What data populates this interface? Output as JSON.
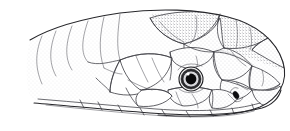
{
  "image": {
    "title": "Snake head, lateral view",
    "subject": "snake-head",
    "view": "lateral left-facing-right",
    "style": "black-and-white stippled scientific line drawing",
    "width": 290,
    "height": 131,
    "background_color": "#ffffff",
    "ink_color": "#26262a",
    "stipple_color": "#55555c"
  },
  "anatomy": {
    "eye": {
      "label": "eye",
      "center_x": 191,
      "center_y": 79,
      "outer_radius": 12,
      "ring_radius": 10,
      "iris_radius": 8,
      "pupil_radius": 5.4,
      "highlight_x": 188,
      "highlight_y": 74,
      "highlight_radius": 1.6,
      "pupil_color": "#0a0a0c",
      "iris_color": "#d8d8dc",
      "ring_color": "#2a2a2e"
    },
    "nostril": {
      "label": "nostril",
      "center_x": 236,
      "center_y": 95,
      "width": 5,
      "height": 8,
      "rotation": -28,
      "color": "#0d0d10"
    },
    "snout": {
      "label": "snout tip",
      "x": 282,
      "y": 90
    },
    "jaw_line": {
      "label": "lower jaw / lip line",
      "start_x": 34,
      "start_y": 104,
      "end_x": 278,
      "end_y": 104
    },
    "crown": {
      "label": "top of head",
      "peak_x": 205,
      "peak_y": 19
    },
    "neck": {
      "label": "neck scales, fading at left edge",
      "x": 8,
      "y": 60
    }
  },
  "regions": [
    {
      "name": "head-shields-dorsal",
      "label": "dorsal head shields",
      "scale_count": 14
    },
    {
      "name": "supraocular-shield",
      "label": "supraocular shield"
    },
    {
      "name": "loreal-preocular",
      "label": "loreal and preocular scales"
    },
    {
      "name": "supralabial-row",
      "label": "supralabial scale row",
      "scale_count": 8
    },
    {
      "name": "temporal-scales",
      "label": "temporal scales"
    },
    {
      "name": "body-scales-dorsal",
      "label": "dorsal body scales",
      "scale_count": 60
    },
    {
      "name": "rostral-shield",
      "label": "rostral shield"
    }
  ],
  "accessibility": {
    "alt_text": "Line drawing of a snake's head in left lateral profile, facing right, showing large smooth head shields, a prominent round eye with dark round pupil, a small slit nostril near the snout, the lower lip line, and overlapping diagonal rows of body scales receding to the left."
  }
}
